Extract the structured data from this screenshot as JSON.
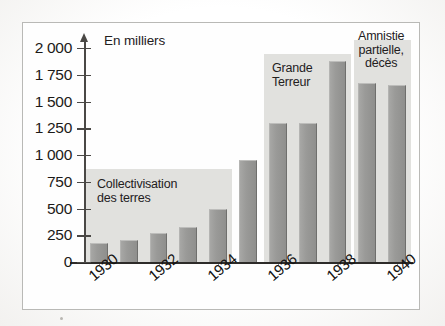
{
  "figure": {
    "unit_caption": "En milliers",
    "frame": true
  },
  "chart_data": {
    "type": "bar",
    "title": "",
    "subtitle": "",
    "xlabel": "",
    "ylabel": "En milliers",
    "ylim": [
      0,
      2000
    ],
    "grid": false,
    "legend_position": "none",
    "categories": [
      "1930",
      "1931",
      "1932",
      "1933",
      "1934",
      "1935",
      "1936",
      "1937",
      "1938",
      "1939",
      "1940"
    ],
    "x_tick_labels": [
      "1930",
      "1932",
      "1934",
      "1936",
      "1938",
      "1940"
    ],
    "y_tick_labels": [
      "2 000",
      "1 750",
      "1 500",
      "1 250",
      "1 000",
      "750",
      "500",
      "250",
      "0"
    ],
    "y_tick_values": [
      2000,
      1750,
      1500,
      1250,
      1000,
      750,
      500,
      250,
      0
    ],
    "values": [
      180,
      210,
      270,
      330,
      500,
      950,
      1300,
      1300,
      1880,
      1670,
      1650
    ],
    "annotations": [
      {
        "label": "Collectivisation\ndes terres",
        "start_category": "1930",
        "end_category": "1934",
        "band_top_value": 870
      },
      {
        "label": "Grande\nTerreur",
        "start_category": "1936",
        "end_category": "1938",
        "band_top_value": 1940
      },
      {
        "label": "Amnistie\npartielle,\ndécès",
        "start_category": "1939",
        "end_category": "1940",
        "band_top_value": 2075
      }
    ]
  },
  "colors": {
    "bar_fill": "#9a9a98",
    "bar_edge_light": "#bdbdbb",
    "bar_edge_dark": "#6f6f6d",
    "band_fill": "#dededb",
    "axis": "#2d2b29",
    "text": "#1c1a18",
    "frame_border": "#b9b9b6",
    "page_background": "#fbfbfa"
  }
}
